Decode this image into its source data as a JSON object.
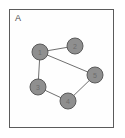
{
  "panel": {
    "label": "A",
    "background_color": "#fefefe",
    "border_color": "#5b5b5b"
  },
  "graph": {
    "type": "undirected-node-link",
    "node_fill_color": "#8f8f8f",
    "node_stroke_color": "#5a5a5a",
    "edge_color": "#6f6f6f",
    "node_radius": 8,
    "nodes": [
      {
        "id": "1",
        "label": "1",
        "x": 31,
        "y": 43
      },
      {
        "id": "2",
        "label": "2",
        "x": 66,
        "y": 37
      },
      {
        "id": "3",
        "label": "3",
        "x": 29,
        "y": 78
      },
      {
        "id": "4",
        "label": "4",
        "x": 59,
        "y": 92
      },
      {
        "id": "5",
        "label": "5",
        "x": 86,
        "y": 66
      }
    ],
    "edges": [
      {
        "source": "1",
        "target": "2"
      },
      {
        "source": "1",
        "target": "3"
      },
      {
        "source": "1",
        "target": "5"
      },
      {
        "source": "3",
        "target": "4"
      },
      {
        "source": "4",
        "target": "5"
      }
    ]
  }
}
